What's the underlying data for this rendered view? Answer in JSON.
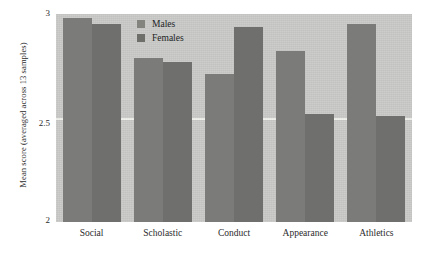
{
  "chart_data": {
    "type": "bar",
    "title": "",
    "xlabel": "",
    "ylabel": "Mean score (averaged across 13 samples)",
    "categories": [
      "Social",
      "Scholastic",
      "Conduct",
      "Appearance",
      "Athletics"
    ],
    "series": [
      {
        "name": "Males",
        "values": [
          2.98,
          2.79,
          2.71,
          2.82,
          2.95
        ]
      },
      {
        "name": "Females",
        "values": [
          2.95,
          2.77,
          2.94,
          2.52,
          2.51
        ]
      }
    ],
    "ylim": [
      2,
      3
    ],
    "yticks": [
      "3",
      "2.5",
      "2"
    ],
    "ytick_values": [
      3,
      2.5,
      2
    ],
    "gridlines": [
      2.5
    ],
    "grid": true,
    "legend_position": "top-center",
    "colors": {
      "plot_background": "#c9c9c7",
      "bar_male": "#7b7b79",
      "bar_female": "#6f6f6d",
      "gridline": "#efefec",
      "text": "#2b2b2b"
    }
  },
  "legend": {
    "items": [
      {
        "label": "Males",
        "swatch": "legend-swatch-male"
      },
      {
        "label": "Females",
        "swatch": "legend-swatch-female"
      }
    ]
  }
}
